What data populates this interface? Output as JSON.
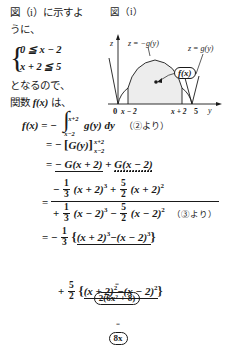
{
  "prose": {
    "line1": "図（i）に示すよ",
    "line2": "うに、",
    "brace": "{",
    "system": [
      "0 ≦ x − 2",
      "x + 2 ≦ 5"
    ],
    "line3": "となるので、",
    "line4_pre": "関数 ",
    "line4_fx": "f(x)",
    "line4_post": " は、"
  },
  "figure": {
    "caption": "図（i）",
    "axis_z": "z",
    "axis_y": "y",
    "origin": "0",
    "tick_left": "x − 2",
    "tick_right": "x + 2",
    "tick_five": "5",
    "curve_label": "z = −g(y)",
    "line_label": "z = g(y)",
    "area_label": "f(x)"
  },
  "derivation": {
    "l1": {
      "lhs": "f(x)",
      "eq": "=",
      "minus": "−",
      "int_upper": "x+2",
      "int_lower": "x−2",
      "integrand": "g(y) dy",
      "ref": "（②より）"
    },
    "l2": {
      "eq": "=",
      "minus": "−",
      "open": "[",
      "body": "G(y)",
      "close": "]",
      "lim_upper": "x+2",
      "lim_lower": "x−2"
    },
    "l3": {
      "eq": "=",
      "term1": "− G(x + 2)",
      "plus": "+",
      "term2": "G(x − 2)"
    },
    "l4": {
      "eq": "=",
      "top": {
        "sign": "−",
        "frac1_n": "1",
        "frac1_d": "3",
        "expr1": "(x + 2)",
        "exp1": "3",
        "plus": "+",
        "frac2_n": "5",
        "frac2_d": "2",
        "expr2": "(x + 2)",
        "exp2": "2"
      },
      "bottom": {
        "sign": "+",
        "frac1_n": "1",
        "frac1_d": "3",
        "expr1": "(x − 2)",
        "exp1": "3",
        "minus": "−",
        "frac2_n": "5",
        "frac2_d": "2",
        "expr2": "(x − 2)",
        "exp2": "2",
        "ref": "（③より）"
      }
    },
    "l5": {
      "eq": "=",
      "sign": "−",
      "frac_n": "1",
      "frac_d": "3",
      "open": "{",
      "expr1": "(x + 2)",
      "exp1": "3",
      "minus": "−",
      "expr2": "(x − 2)",
      "exp2": "3",
      "close": "}",
      "annot_eq": "=",
      "annot": "2(6x² + 8)"
    },
    "l6": {
      "sign": "+",
      "frac_n": "5",
      "frac_d": "2",
      "open": "{",
      "expr1": "(x + 2)",
      "exp1": "2",
      "minus": "−",
      "expr2": "(x − 2)",
      "exp2": "2",
      "close": "}",
      "annot_eq": "=",
      "annot": "8x"
    }
  },
  "colors": {
    "ink": "#1a1a1a",
    "fill": "#eeeeee"
  }
}
